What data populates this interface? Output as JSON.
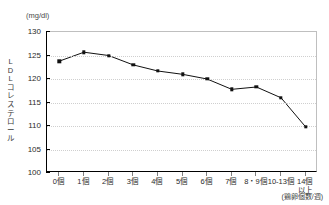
{
  "title_strip": "",
  "axes": {
    "y_unit": "(mg/dl)",
    "y_title_chars": [
      "L",
      "D",
      "L",
      "コ",
      "レ",
      "ス",
      "テ",
      "ロ",
      "ー",
      "ル"
    ],
    "x_note": "(鶏卵個数/週)"
  },
  "chart_data": {
    "type": "line",
    "title": "",
    "xlabel": "(鶏卵個数/週)",
    "ylabel": "LDLコレステロール",
    "y_unit": "(mg/dl)",
    "categories": [
      "0個",
      "1個",
      "2個",
      "3個",
      "4個",
      "5個",
      "6個",
      "7個",
      "8・9個",
      "10-13個",
      "14個\n以上"
    ],
    "category_labels": [
      {
        "line1": "0個",
        "line2": ""
      },
      {
        "line1": "1個",
        "line2": ""
      },
      {
        "line1": "2個",
        "line2": ""
      },
      {
        "line1": "3個",
        "line2": ""
      },
      {
        "line1": "4個",
        "line2": ""
      },
      {
        "line1": "5個",
        "line2": ""
      },
      {
        "line1": "6個",
        "line2": ""
      },
      {
        "line1": "7個",
        "line2": ""
      },
      {
        "line1": "8・9個",
        "line2": ""
      },
      {
        "line1": "10-13個",
        "line2": ""
      },
      {
        "line1": "14個",
        "line2": "以上"
      }
    ],
    "values": [
      123.8,
      125.7,
      125.0,
      123.0,
      121.7,
      121.0,
      120.0,
      117.8,
      118.3,
      116.0,
      109.8
    ],
    "ylim": [
      100,
      130
    ],
    "yticks": [
      100,
      105,
      110,
      115,
      120,
      125,
      130
    ],
    "ytick_labels": [
      "100",
      "105",
      "110",
      "115",
      "120",
      "125",
      "130"
    ],
    "grid": true,
    "legend": "none",
    "marker": "square",
    "line_color": "#111111",
    "marker_color": "#111111",
    "grid_color": "#cfcfcf"
  }
}
